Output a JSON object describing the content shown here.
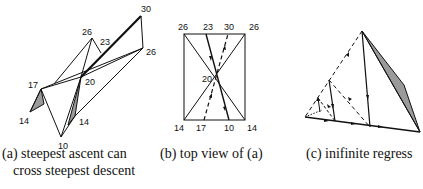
{
  "figure_a": {
    "labels": {
      "v30": "30",
      "v26_right": "26",
      "v26_top": "26",
      "v23": "23",
      "v20": "20",
      "v17": "17",
      "v14_left": "14",
      "v14_right": "14",
      "v10": "10"
    },
    "caption_line1": "(a) steepest ascent can",
    "caption_line2": "cross steepest descent"
  },
  "figure_b": {
    "top_labels": [
      "26",
      "23",
      "30",
      "26"
    ],
    "bottom_labels": [
      "14",
      "17",
      "10",
      "14"
    ],
    "center_label": "20",
    "caption": "(b) top view of (a)"
  },
  "figure_c": {
    "caption": "(c) inifinite regress"
  },
  "colors": {
    "line": "#111111",
    "shade": "#9a9a9a"
  }
}
